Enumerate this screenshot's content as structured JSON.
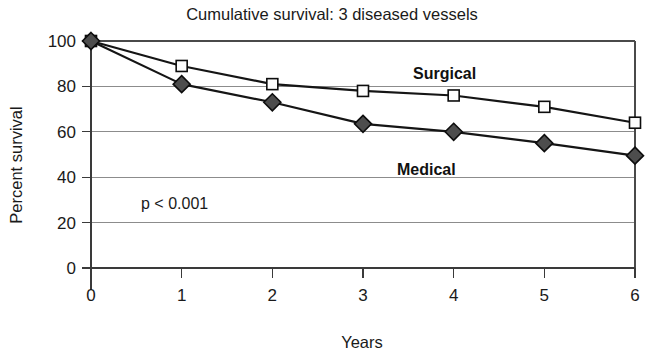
{
  "chart_data": {
    "type": "line",
    "title": "Cumulative survival: 3 diseased vessels",
    "xlabel": "Years",
    "ylabel": "Percent survival",
    "x": [
      0,
      1,
      2,
      3,
      4,
      5,
      6
    ],
    "xticklabels": [
      "0",
      "1",
      "2",
      "3",
      "4",
      "5",
      "6"
    ],
    "yticklabels": [
      "0",
      "20",
      "40",
      "60",
      "80",
      "100"
    ],
    "yticks": [
      0,
      20,
      40,
      60,
      80,
      100
    ],
    "xlim": [
      0,
      6
    ],
    "ylim": [
      0,
      100
    ],
    "grid": "horizontal",
    "legend": "inline-labels",
    "series": [
      {
        "name": "Surgical",
        "marker": "open-square",
        "marker_fill": "#fdfdfd",
        "line_color": "#151515",
        "values": [
          100,
          89,
          81,
          78,
          76,
          71,
          64
        ]
      },
      {
        "name": "Medical",
        "marker": "filled-diamond",
        "marker_fill": "#4d4d4d",
        "line_color": "#151515",
        "values": [
          100,
          81,
          73,
          63.5,
          60,
          55,
          49.5
        ]
      }
    ],
    "annotations": [
      {
        "text": "p < 0.001",
        "x": 0.55,
        "y": 28
      }
    ]
  },
  "labels": {
    "surgical": "Surgical",
    "medical": "Medical",
    "pvalue": "p < 0.001"
  }
}
